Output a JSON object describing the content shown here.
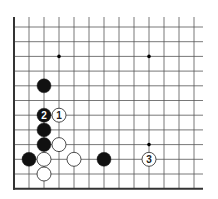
{
  "board": {
    "origin_x": 14,
    "origin_y": 27,
    "spacing_x": 15,
    "spacing_y": 14.7,
    "cols": 13,
    "rows": 12,
    "left_edge": true,
    "bottom_edge": true,
    "line_color": "#555555",
    "edge_color": "#333333",
    "star_points": [
      [
        3,
        2
      ],
      [
        9,
        2
      ],
      [
        9,
        8
      ]
    ]
  },
  "stones": [
    {
      "color": "black",
      "col": 2,
      "row": 4,
      "label": ""
    },
    {
      "color": "black",
      "col": 2,
      "row": 6,
      "label": "2"
    },
    {
      "color": "white",
      "col": 3,
      "row": 6,
      "label": "1"
    },
    {
      "color": "black",
      "col": 2,
      "row": 7,
      "label": ""
    },
    {
      "color": "black",
      "col": 2,
      "row": 8,
      "label": ""
    },
    {
      "color": "white",
      "col": 3,
      "row": 8,
      "label": ""
    },
    {
      "color": "black",
      "col": 1,
      "row": 9,
      "label": ""
    },
    {
      "color": "white",
      "col": 2,
      "row": 9,
      "label": ""
    },
    {
      "color": "white",
      "col": 4,
      "row": 9,
      "label": ""
    },
    {
      "color": "black",
      "col": 6,
      "row": 9,
      "label": ""
    },
    {
      "color": "white",
      "col": 9,
      "row": 9,
      "label": "3"
    },
    {
      "color": "white",
      "col": 2,
      "row": 10,
      "label": ""
    }
  ]
}
